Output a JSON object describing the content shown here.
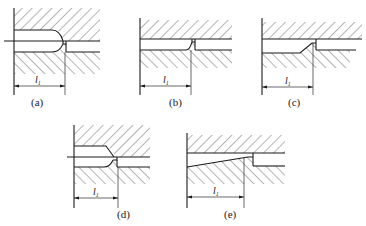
{
  "figure": {
    "panels": [
      {
        "id": "a",
        "caption": "(a)",
        "dimension_label": "l",
        "dimension_subscript": "1"
      },
      {
        "id": "b",
        "caption": "(b)",
        "dimension_label": "l",
        "dimension_subscript": "1"
      },
      {
        "id": "c",
        "caption": "(c)",
        "dimension_label": "l",
        "dimension_subscript": "1"
      },
      {
        "id": "d",
        "caption": "(d)",
        "dimension_label": "l",
        "dimension_subscript": "1"
      },
      {
        "id": "e",
        "caption": "(e)",
        "dimension_label": "l",
        "dimension_subscript": "1"
      }
    ],
    "colors": {
      "line": "#1a1a1a",
      "background": "#ffffff"
    }
  }
}
